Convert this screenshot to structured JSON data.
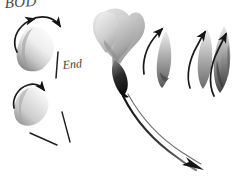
{
  "figure": {
    "title_text": "BOD",
    "background_color": "#ffffff",
    "ink_color": "#1a1a1a",
    "width": 239,
    "height": 185
  },
  "labels": [
    {
      "id": "bod",
      "text": "BOD",
      "x": 4,
      "y": -5
    },
    {
      "id": "end",
      "text": "End",
      "x": 62,
      "y": 58
    }
  ],
  "strokes": [
    {
      "name": "upper-left-blob",
      "description": "rounded grey brush blob, light fill, darker lower-left edge",
      "tone_light": "#f2f2f2",
      "tone_mid": "#bfbfbf",
      "tone_dark": "#8a8a8a"
    },
    {
      "name": "lower-left-blob",
      "description": "smaller tapered grey brush blob below the first",
      "tone_light": "#f4f4f4",
      "tone_mid": "#c4c4c4",
      "tone_dark": "#909090"
    },
    {
      "name": "central-cloud-head",
      "description": "large lumpy cumulus-like head of overlapping lobes",
      "tone_light": "#ededed",
      "tone_mid": "#b8b8b8",
      "tone_dark": "#7d7d7d"
    },
    {
      "name": "central-dark-neck",
      "description": "dense black wedge where head narrows into the tail",
      "tone_dark": "#101010"
    },
    {
      "name": "central-tail",
      "description": "long curved double-line tail sweeping down to the right",
      "tone_dark": "#1a1a1a"
    },
    {
      "name": "right-teardrop-1",
      "description": "narrow teardrop, dark at base fading upward",
      "tone_mid": "#9a9a9a",
      "tone_dark": "#4a4a4a"
    },
    {
      "name": "right-teardrop-2",
      "description": "slim flame stroke, mid grey",
      "tone_mid": "#a8a8a8",
      "tone_dark": "#5a5a5a"
    },
    {
      "name": "right-teardrop-3",
      "description": "layered flame stroke with striations, darkest of the group",
      "tone_mid": "#8e8e8e",
      "tone_dark": "#3a3a3a"
    }
  ],
  "arrows": [
    {
      "name": "arrow-upleft-top",
      "direction": "up-left",
      "style": "curved"
    },
    {
      "name": "arrow-arc-right-top",
      "direction": "right",
      "style": "arc"
    },
    {
      "name": "arrow-curl-lower-left",
      "direction": "up-right",
      "style": "curved"
    },
    {
      "name": "arrow-tail-end",
      "direction": "down-right",
      "style": "straight"
    },
    {
      "name": "arrow-up-right-1",
      "direction": "up",
      "style": "curved"
    },
    {
      "name": "arrow-up-right-2",
      "direction": "up",
      "style": "curved"
    },
    {
      "name": "arrow-up-right-3",
      "direction": "up",
      "style": "curved"
    }
  ],
  "guide_lines": [
    {
      "name": "guide-end-tick",
      "orientation": "vertical"
    },
    {
      "name": "guide-diagonal-a",
      "orientation": "diagonal"
    },
    {
      "name": "guide-diagonal-b",
      "orientation": "diagonal"
    }
  ]
}
